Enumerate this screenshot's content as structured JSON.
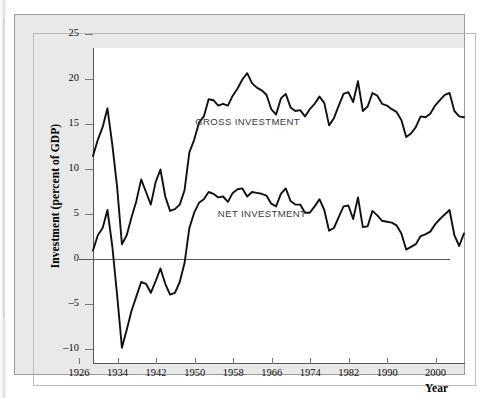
{
  "figure": {
    "background": "#e9e9e9",
    "plot_background": "#ffffff",
    "line_color": "#111111"
  },
  "axes": {
    "ytitle": "Investment (percent of GDP)",
    "xtitle": "Year",
    "yticks": [
      25,
      20,
      15,
      10,
      5,
      0,
      -5,
      -10
    ],
    "ylabels": [
      "25",
      "20",
      "15",
      "10",
      "5",
      "0",
      "–5",
      "–10"
    ],
    "xticks": [
      1926,
      1934,
      1942,
      1950,
      1958,
      1966,
      1974,
      1982,
      1990,
      2000
    ],
    "xlabels": [
      "1926",
      "1934",
      "1942",
      "1950",
      "1958",
      "1966",
      "1974",
      "1982",
      "1990",
      "2000"
    ],
    "ylim": [
      -10,
      25
    ],
    "xlim": [
      1926,
      2003
    ],
    "grid": false,
    "zero_line": true
  },
  "annotations": [
    {
      "text": "GROSS INVESTMENT",
      "x": 1961,
      "y": 15.2
    },
    {
      "text": "NET INVESTMENT",
      "x": 1964,
      "y": 5.0
    }
  ],
  "chart_data": {
    "type": "line",
    "title": "",
    "subtitle": "",
    "xlabel": "Year",
    "ylabel": "Investment (percent of GDP)",
    "xlim": [
      1926,
      2003
    ],
    "ylim": [
      -10,
      25
    ],
    "grid": false,
    "legend": "inline-annotations",
    "x": [
      1926,
      1927,
      1928,
      1929,
      1930,
      1931,
      1932,
      1933,
      1934,
      1935,
      1936,
      1937,
      1938,
      1939,
      1940,
      1941,
      1942,
      1943,
      1944,
      1945,
      1946,
      1947,
      1948,
      1949,
      1950,
      1951,
      1952,
      1953,
      1954,
      1955,
      1956,
      1957,
      1958,
      1959,
      1960,
      1961,
      1962,
      1963,
      1964,
      1965,
      1966,
      1967,
      1968,
      1969,
      1970,
      1971,
      1972,
      1973,
      1974,
      1975,
      1976,
      1977,
      1978,
      1979,
      1980,
      1981,
      1982,
      1983,
      1984,
      1985,
      1986,
      1987,
      1988,
      1989,
      1990,
      1991,
      1992,
      1993,
      1994,
      1995,
      1996,
      1997,
      1998,
      1999,
      2000,
      2001,
      2002,
      2003
    ],
    "series": [
      {
        "name": "GROSS INVESTMENT",
        "values": [
          13.0,
          14.8,
          16.2,
          18.3,
          14.3,
          9.6,
          3.2,
          4.2,
          6.2,
          8.0,
          10.4,
          9.0,
          7.6,
          10.1,
          11.5,
          8.5,
          6.9,
          7.1,
          7.6,
          9.2,
          13.4,
          14.8,
          16.7,
          17.4,
          19.3,
          19.2,
          18.6,
          18.8,
          18.6,
          19.7,
          20.5,
          21.5,
          22.2,
          21.1,
          20.6,
          20.3,
          19.8,
          18.2,
          17.6,
          19.4,
          19.9,
          18.4,
          18.0,
          18.1,
          17.4,
          18.2,
          18.8,
          19.6,
          18.9,
          16.4,
          17.2,
          18.6,
          19.9,
          20.1,
          19.0,
          21.3,
          18.0,
          18.5,
          20.0,
          19.7,
          18.8,
          18.6,
          18.2,
          17.9,
          17.0,
          15.1,
          15.5,
          16.2,
          17.4,
          17.3,
          17.7,
          18.6,
          19.2,
          19.8,
          20.0,
          18.0,
          17.4,
          17.3
        ]
      },
      {
        "name": "NET INVESTMENT",
        "values": [
          2.5,
          4.2,
          5.0,
          7.0,
          3.0,
          -2.4,
          -8.3,
          -6.3,
          -4.2,
          -2.6,
          -1.0,
          -1.2,
          -2.2,
          -0.9,
          0.5,
          -1.2,
          -2.4,
          -2.2,
          -1.0,
          1.1,
          5.0,
          6.7,
          7.8,
          8.2,
          9.0,
          8.8,
          8.4,
          8.5,
          7.9,
          8.9,
          9.3,
          9.4,
          8.5,
          9.0,
          8.9,
          8.8,
          8.6,
          7.7,
          7.4,
          8.8,
          9.4,
          8.0,
          7.6,
          7.6,
          6.7,
          6.7,
          7.4,
          8.2,
          7.0,
          4.7,
          5.0,
          6.2,
          7.4,
          7.5,
          6.0,
          8.4,
          5.1,
          5.2,
          6.9,
          6.4,
          5.8,
          5.7,
          5.6,
          5.3,
          4.4,
          2.6,
          2.9,
          3.2,
          4.1,
          4.3,
          4.6,
          5.4,
          6.0,
          6.5,
          7.0,
          4.2,
          3.0,
          4.4
        ]
      }
    ]
  }
}
